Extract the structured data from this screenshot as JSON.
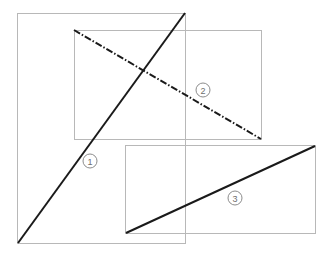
{
  "figure": {
    "canvas": {
      "width": 333,
      "height": 256,
      "background": "#ffffff"
    },
    "colors": {
      "rectangle_stroke": "#b8b8b8",
      "line_stroke": "#1a1a1a",
      "label_stroke": "#8c8c8c",
      "label_text": "#6e6e6e",
      "background": "#ffffff"
    },
    "rectangles": [
      {
        "id": "rect-1",
        "name": "large-left-rectangle",
        "x": 17,
        "y": 13,
        "width": 168,
        "height": 230,
        "stroke": "#b8b8b8",
        "stroke_width": 1
      },
      {
        "id": "rect-2",
        "name": "upper-right-rectangle",
        "x": 74,
        "y": 30,
        "width": 187,
        "height": 109,
        "stroke": "#b8b8b8",
        "stroke_width": 1
      },
      {
        "id": "rect-3",
        "name": "lower-right-rectangle",
        "x": 125,
        "y": 145,
        "width": 190,
        "height": 88,
        "stroke": "#b8b8b8",
        "stroke_width": 1
      }
    ],
    "lines": [
      {
        "id": "line-1",
        "name": "diagonal-line-1",
        "label": "1",
        "style": "solid",
        "dash_array": "",
        "x1": 18,
        "y1": 243,
        "x2": 185,
        "y2": 13,
        "stroke": "#1a1a1a",
        "stroke_width": 2
      },
      {
        "id": "line-2",
        "name": "diagonal-line-2",
        "label": "2",
        "style": "dash-dot",
        "dash_array": "7 2 1.5 2",
        "x1": 74,
        "y1": 30,
        "x2": 261,
        "y2": 139,
        "stroke": "#1a1a1a",
        "stroke_width": 2
      },
      {
        "id": "line-3",
        "name": "diagonal-line-3",
        "label": "3",
        "style": "solid",
        "dash_array": "",
        "x1": 126,
        "y1": 233,
        "x2": 315,
        "y2": 146,
        "stroke": "#1a1a1a",
        "stroke_width": 2
      }
    ],
    "labels": [
      {
        "id": "label-1",
        "name": "circled-number-1",
        "text": "1",
        "cx": 90,
        "cy": 161,
        "r": 7
      },
      {
        "id": "label-2",
        "name": "circled-number-2",
        "text": "2",
        "cx": 203,
        "cy": 90,
        "r": 7
      },
      {
        "id": "label-3",
        "name": "circled-number-3",
        "text": "3",
        "cx": 235,
        "cy": 198,
        "r": 7
      }
    ]
  }
}
